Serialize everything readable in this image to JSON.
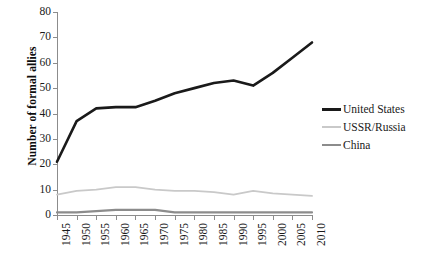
{
  "chart_data": {
    "type": "line",
    "title": "",
    "xlabel": "",
    "ylabel": "Number of formal allies",
    "x": [
      1945,
      1950,
      1955,
      1960,
      1965,
      1970,
      1975,
      1980,
      1985,
      1990,
      1995,
      2000,
      2005,
      2010
    ],
    "xtick_labels": [
      "1945",
      "1950",
      "1955",
      "1960",
      "1965",
      "1970",
      "1975",
      "1980",
      "1985",
      "1990",
      "1995",
      "2000",
      "2005",
      "2010"
    ],
    "ytick_labels": [
      "0",
      "10",
      "20",
      "30",
      "40",
      "50",
      "60",
      "70",
      "80"
    ],
    "ylim": [
      0,
      80
    ],
    "ytick_step": 10,
    "xlim": [
      1945,
      2010
    ],
    "grid": false,
    "legend_position": "right",
    "series": [
      {
        "name": "United States",
        "color": "#1a1a1a",
        "width": 2.6,
        "values": [
          21,
          37,
          42,
          42.5,
          42.5,
          45,
          48,
          50,
          52,
          53,
          51,
          56,
          62,
          68
        ]
      },
      {
        "name": "USSR/Russia",
        "color": "#c9c9c9",
        "width": 1.8,
        "values": [
          8,
          9.5,
          10,
          11,
          11,
          10,
          9.5,
          9.5,
          9,
          8,
          9.5,
          8.5,
          8,
          7.5
        ]
      },
      {
        "name": "China",
        "color": "#8c8c8c",
        "width": 2.2,
        "values": [
          1,
          1,
          1.5,
          2,
          2,
          2,
          1,
          1,
          1,
          1,
          1,
          1,
          1,
          1
        ]
      }
    ]
  },
  "legend": {
    "entries": [
      {
        "label": "United States"
      },
      {
        "label": "USSR/Russia"
      },
      {
        "label": "China"
      }
    ]
  }
}
